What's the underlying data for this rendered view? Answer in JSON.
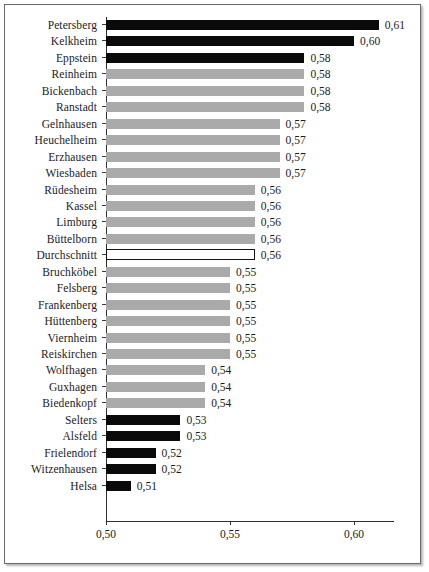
{
  "chart_data": {
    "type": "bar",
    "orientation": "horizontal",
    "title": "",
    "xlabel": "",
    "ylabel": "",
    "xlim": [
      0.5,
      0.6258
    ],
    "grid": false,
    "legend": null,
    "xticks": [
      "0,50",
      "0,55",
      "0,60"
    ],
    "xtick_values": [
      0.5,
      0.55,
      0.6
    ],
    "decimal_separator": ",",
    "colors": {
      "highlight": "#0a0a0a",
      "default": "#aaaaaa",
      "average_fill": "#ffffff",
      "average_border": "#141414",
      "axis": "#2e2e2e",
      "text": "#1b1b1b"
    },
    "categories": [
      "Petersberg",
      "Kelkheim",
      "Eppstein",
      "Reinheim",
      "Bickenbach",
      "Ranstadt",
      "Gelnhausen",
      "Heuchelheim",
      "Erzhausen",
      "Wiesbaden",
      "Rüdesheim",
      "Kassel",
      "Limburg",
      "Büttelborn",
      "Durchschnitt",
      "Bruchköbel",
      "Felsberg",
      "Frankenberg",
      "Hüttenberg",
      "Viernheim",
      "Reiskirchen",
      "Wolfhagen",
      "Guxhagen",
      "Biedenkopf",
      "Selters",
      "Alsfeld",
      "Frielendorf",
      "Witzenhausen",
      "Helsa"
    ],
    "values": [
      0.61,
      0.6,
      0.58,
      0.58,
      0.58,
      0.58,
      0.57,
      0.57,
      0.57,
      0.57,
      0.56,
      0.56,
      0.56,
      0.56,
      0.56,
      0.55,
      0.55,
      0.55,
      0.55,
      0.55,
      0.55,
      0.54,
      0.54,
      0.54,
      0.53,
      0.53,
      0.52,
      0.52,
      0.51
    ],
    "value_labels": [
      "0,61",
      "0,60",
      "0,58",
      "0,58",
      "0,58",
      "0,58",
      "0,57",
      "0,57",
      "0,57",
      "0,57",
      "0,56",
      "0,56",
      "0,56",
      "0,56",
      "0,56",
      "0,55",
      "0,55",
      "0,55",
      "0,55",
      "0,55",
      "0,55",
      "0,54",
      "0,54",
      "0,54",
      "0,53",
      "0,53",
      "0,52",
      "0,52",
      "0,51"
    ],
    "bar_styles": [
      "black",
      "black",
      "black",
      "gray",
      "gray",
      "gray",
      "gray",
      "gray",
      "gray",
      "gray",
      "gray",
      "gray",
      "gray",
      "gray",
      "avg",
      "gray",
      "gray",
      "gray",
      "gray",
      "gray",
      "gray",
      "gray",
      "gray",
      "gray",
      "black",
      "black",
      "black",
      "black",
      "black"
    ]
  }
}
